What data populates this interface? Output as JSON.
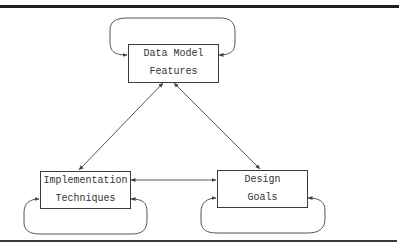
{
  "diagram": {
    "type": "concept-relationship",
    "nodes": [
      {
        "id": "data-model-features",
        "lines": [
          "Data Model",
          "Features"
        ]
      },
      {
        "id": "implementation-techniques",
        "lines": [
          "Implementation",
          "Techniques"
        ]
      },
      {
        "id": "design-goals",
        "lines": [
          "Design",
          "Goals"
        ]
      }
    ],
    "edges": [
      {
        "from": "data-model-features",
        "to": "data-model-features",
        "kind": "self-loop",
        "arrows": "both"
      },
      {
        "from": "implementation-techniques",
        "to": "implementation-techniques",
        "kind": "self-loop",
        "arrows": "both"
      },
      {
        "from": "design-goals",
        "to": "design-goals",
        "kind": "self-loop",
        "arrows": "both"
      },
      {
        "from": "data-model-features",
        "to": "implementation-techniques",
        "kind": "line",
        "arrows": "both"
      },
      {
        "from": "data-model-features",
        "to": "design-goals",
        "kind": "line",
        "arrows": "both"
      },
      {
        "from": "implementation-techniques",
        "to": "design-goals",
        "kind": "line",
        "arrows": "both"
      }
    ]
  },
  "colors": {
    "stroke": "#444444",
    "rule": "#222222",
    "text": "#333333",
    "background": "#ffffff"
  }
}
